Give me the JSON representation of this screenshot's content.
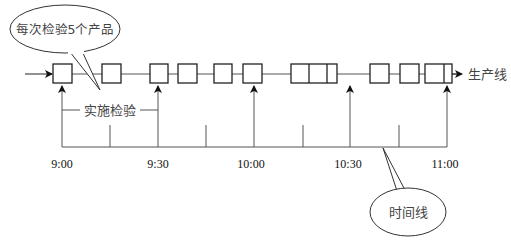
{
  "diagram": {
    "title_bubble": "每次检验5个产品",
    "inspection_label": "实施检验",
    "production_line_label": "生产线",
    "timeline_bubble": "时间线",
    "time_labels": [
      "9:00",
      "9:30",
      "10:00",
      "10:30",
      "11:00"
    ],
    "colors": {
      "line": "#222222",
      "label": "#555555"
    }
  }
}
